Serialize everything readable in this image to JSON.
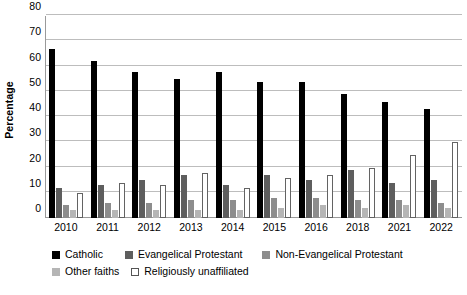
{
  "chart_data": {
    "type": "bar",
    "title": "",
    "subtitle": "",
    "xlabel": "",
    "ylabel": "Percentage",
    "ylim": [
      0,
      80
    ],
    "yticks": [
      0,
      10,
      20,
      30,
      40,
      50,
      60,
      70,
      80
    ],
    "ytick_labels": [
      "0",
      "10",
      "20",
      "30",
      "40",
      "50",
      "60",
      "70",
      "80"
    ],
    "grid": true,
    "legend_position": "bottom-left",
    "categories": [
      "2010",
      "2011",
      "2012",
      "2013",
      "2014",
      "2015",
      "2016",
      "2018",
      "2021",
      "2022"
    ],
    "series": [
      {
        "name": "Catholic",
        "color": "#000000",
        "values": [
          67,
          62,
          58,
          55,
          58,
          54,
          54,
          49,
          46,
          43
        ]
      },
      {
        "name": "Evangelical Protestant",
        "color": "#5e5e5e",
        "values": [
          12,
          13,
          15,
          17,
          13,
          17,
          15,
          19,
          14,
          15
        ]
      },
      {
        "name": "Non-Evangelical Protestant",
        "color": "#8d8d8d",
        "values": [
          5,
          6,
          6,
          7,
          7,
          8,
          8,
          7,
          7,
          6
        ]
      },
      {
        "name": "Other faiths",
        "color": "#b5b5b5",
        "values": [
          3,
          3,
          3,
          3,
          3,
          4,
          5,
          4,
          5,
          4
        ]
      },
      {
        "name": "Religiously unaffiliated",
        "color": "#ffffff",
        "values": [
          10,
          14,
          13,
          18,
          12,
          16,
          17,
          20,
          25,
          30
        ]
      }
    ]
  },
  "legend": {
    "rows": [
      [
        {
          "label": "Catholic",
          "swatch": "#000000",
          "outlined": false
        },
        {
          "label": "Evangelical Protestant",
          "swatch": "#5e5e5e",
          "outlined": false
        },
        {
          "label": "Non-Evangelical Protestant",
          "swatch": "#8d8d8d",
          "outlined": false
        }
      ],
      [
        {
          "label": "Other faiths",
          "swatch": "#b5b5b5",
          "outlined": false
        },
        {
          "label": "Religiously unaffiliated",
          "swatch": "#ffffff",
          "outlined": true
        }
      ]
    ]
  },
  "axis": {
    "y_title": "Percentage"
  }
}
